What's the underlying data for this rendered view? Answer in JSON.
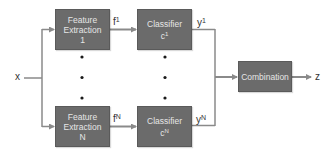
{
  "diagram": {
    "input_label": "x",
    "output_label": "z",
    "branches": [
      {
        "feature_box": {
          "line1": "Feature",
          "line2": "Extraction",
          "line3": "1"
        },
        "feature_label": {
          "base": "f",
          "sup": "1"
        },
        "classifier_box": {
          "line1": "Classifier",
          "line2_base": "c",
          "line2_sup": "1"
        },
        "output_label": {
          "base": "y",
          "sup": "1"
        }
      },
      {
        "feature_box": {
          "line1": "Feature",
          "line2": "Extraction",
          "line3": "N"
        },
        "feature_label": {
          "base": "f",
          "sup": "N"
        },
        "classifier_box": {
          "line1": "Classifier",
          "line2_base": "c",
          "line2_sup": "N"
        },
        "output_label": {
          "base": "y",
          "sup": "N"
        }
      }
    ],
    "combination_box": {
      "label": "Combination"
    },
    "ellipsis": "vertical dots between branch 1 and branch N",
    "colors": {
      "box_fill": "#6b6b6b",
      "box_text": "#e6e6e6",
      "line": "#8a8a8a",
      "dot": "#1a1a1a",
      "label": "#333333"
    }
  }
}
